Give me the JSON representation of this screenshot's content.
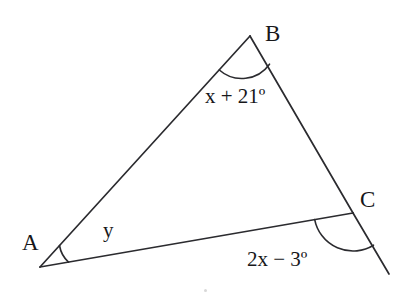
{
  "figure": {
    "type": "geometry-diagram",
    "background_color": "#ffffff",
    "stroke_color": "#2b2b2f",
    "text_color": "#17171a",
    "width": 412,
    "height": 305
  },
  "vertices": [
    {
      "name": "A",
      "label": "A",
      "x": 40,
      "y": 267
    },
    {
      "name": "B",
      "label": "B",
      "x": 250,
      "y": 36
    },
    {
      "name": "C",
      "label": "C",
      "x": 353,
      "y": 213
    }
  ],
  "segments": [
    {
      "name": "side-AB",
      "from": "A",
      "to": "B"
    },
    {
      "name": "side-BC",
      "from": "B",
      "to": "C"
    },
    {
      "name": "side-AC",
      "from": "A",
      "to": "C"
    },
    {
      "name": "ray-BC-extension",
      "from": "C",
      "to": "exterior-point",
      "x1": 353,
      "y1": 213,
      "x2": 389,
      "y2": 274
    }
  ],
  "angles": [
    {
      "name": "angle-at-B",
      "vertex": "B",
      "label": "x + 21º",
      "expression": "x + 21",
      "unit": "º",
      "arc_radius": 34,
      "kind": "interior"
    },
    {
      "name": "angle-at-A",
      "vertex": "A",
      "label": "y",
      "expression": "y",
      "unit": "",
      "arc_radius": 29,
      "kind": "interior"
    },
    {
      "name": "exterior-angle-at-C",
      "vertex": "C",
      "label": "2x − 3º",
      "expression": "2x - 3",
      "unit": "º",
      "arc_radius": 39,
      "kind": "exterior"
    }
  ],
  "labels": {
    "vertex_a": "A",
    "vertex_b": "B",
    "vertex_c": "C",
    "angle_b_expression": "x + 21º",
    "angle_a_expression": "y",
    "angle_c_expression": "2x − 3º"
  }
}
